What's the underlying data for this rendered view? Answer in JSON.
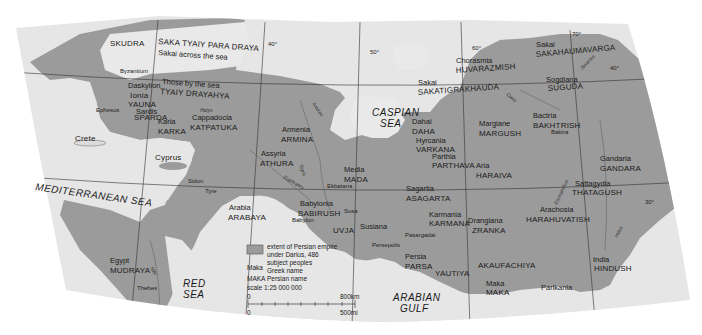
{
  "map": {
    "colors": {
      "background": "#ffffff",
      "land_outside": "#e4e4e4",
      "empire": "#9b9b9b",
      "water": "#e9e9e9",
      "graticule": "#333333",
      "river": "#666666"
    },
    "seas": {
      "mediterranean": "MEDITERRANEAN SEA",
      "caspian_1": "CASPIAN",
      "caspian_2": "SEA",
      "red_1": "RED",
      "red_2": "SEA",
      "arabian_1": "ARABIAN",
      "arabian_2": "GULF"
    },
    "regions": [
      {
        "greek": "",
        "persian": "SKUDRA"
      },
      {
        "greek": "Sakai across the sea",
        "persian": "SAKA TYAIY PARA DRAYA"
      },
      {
        "greek": "Those by the sea",
        "persian": "TYAIY DRAYAHYA"
      },
      {
        "greek": "Ionia",
        "persian": "YAUNA"
      },
      {
        "greek": "Karia",
        "persian": "KARKA"
      },
      {
        "greek": "Cappadocia",
        "persian": "KATPATUKA"
      },
      {
        "greek": "Armenia",
        "persian": "ARMINA"
      },
      {
        "greek": "Assyria",
        "persian": "ATHURA"
      },
      {
        "greek": "Media",
        "persian": "MADA"
      },
      {
        "greek": "Babylonia",
        "persian": "BABIRUSH"
      },
      {
        "greek": "Arabia",
        "persian": "ARABAYA"
      },
      {
        "greek": "Egypt",
        "persian": "MUDRAYA"
      },
      {
        "greek": "Susiana",
        "persian": "UVJA"
      },
      {
        "greek": "Persia",
        "persian": "PARSA"
      },
      {
        "greek": "",
        "persian": "YAUTIYA"
      },
      {
        "greek": "Sagartia",
        "persian": "ASAGARTA"
      },
      {
        "greek": "Karmania",
        "persian": "KARMANA"
      },
      {
        "greek": "Drangiana",
        "persian": "ZRANKA"
      },
      {
        "greek": "Dahai",
        "persian": "DAHA"
      },
      {
        "greek": "Hyrcania",
        "persian": "VARKANA"
      },
      {
        "greek": "Parthia",
        "persian": "PARTHAVA"
      },
      {
        "greek": "Margiane",
        "persian": "MARGUSH"
      },
      {
        "greek": "Aria",
        "persian": "HARAIVA"
      },
      {
        "greek": "Sakai",
        "persian": "SAKATIGRAKHAUDA"
      },
      {
        "greek": "Chorasmia",
        "persian": "HUVARAZMISH"
      },
      {
        "greek": "Sakai",
        "persian": "SAKAHAUMAVARGA"
      },
      {
        "greek": "Sogdiana",
        "persian": "SUGUDA"
      },
      {
        "greek": "Bactria",
        "persian": "BAKHTRISH"
      },
      {
        "greek": "Sattagydia",
        "persian": "THATAGUSH"
      },
      {
        "greek": "Arachosia",
        "persian": "HARAHUVATISH"
      },
      {
        "greek": "Gandaria",
        "persian": "GANDARA"
      },
      {
        "greek": "India",
        "persian": "HINDUSH"
      },
      {
        "greek": "",
        "persian": "AKAUFACHIYA"
      },
      {
        "greek": "Maka",
        "persian": "MAKA"
      },
      {
        "greek": "",
        "persian": "Parikania"
      }
    ],
    "other_labels": {
      "crete": "Crete",
      "cyprus": "Cyprus",
      "daskylion": "Daskylion",
      "sparda_greek": "Sardis",
      "sparda": "SPARDA"
    },
    "cities": {
      "byzantium": "Byzantium",
      "ephesus": "Ephesus",
      "sidon": "Sidon",
      "tyre": "Tyre",
      "ekbatana": "Ekbatana",
      "babylon": "Babylon",
      "susa": "Susa",
      "persepolis": "Persepolis",
      "pasargadai": "Pasargadai",
      "thebes": "Thebes",
      "baktra": "Baktra"
    },
    "rivers": {
      "halys": "Halys",
      "euphrates": "Euphrates",
      "tigris": "Tigris",
      "nile": "Nile",
      "araxes": "Araxes",
      "oxus": "Oxus",
      "jaxartes": "Jaxartes",
      "erymandrus": "Erymandrus",
      "indus": "Indus"
    },
    "graticule": {
      "lon_40": "40°",
      "lon_50": "50°",
      "lon_60": "60°",
      "lon_70": "70°",
      "lat_40": "40°",
      "lat_30": "30°"
    },
    "legend": {
      "swatch_line1": "extent of Persian empire",
      "swatch_line2": "under Darius, 486",
      "subject_peoples": "subject peoples",
      "greek_sample": "Maka",
      "greek_desc": "Greek name",
      "persian_sample": "MAKA",
      "persian_desc": "Persian name",
      "scale": "scale 1:25 000 000",
      "km_zero": "0",
      "km_max": "800km",
      "mi_zero": "0",
      "mi_max": "500mi"
    }
  }
}
